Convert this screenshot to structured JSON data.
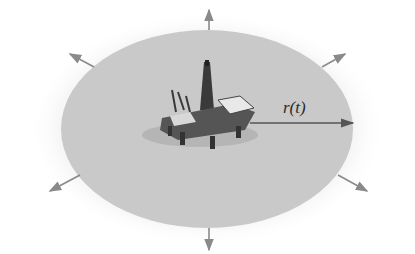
{
  "diagram": {
    "radius_label": "r(t)",
    "colors": {
      "slick": "#c9c9c9",
      "halo": "#ececec",
      "arrow": "#8a8a8a",
      "radius_arrow": "#555555",
      "rig_dark": "#3a3a3a",
      "rig_light": "#e8e8e8"
    },
    "outward_arrows": [
      "up",
      "down",
      "upper-left",
      "upper-right",
      "lower-left",
      "lower-right"
    ]
  }
}
